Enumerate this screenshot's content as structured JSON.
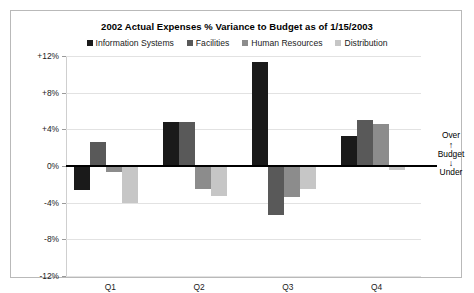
{
  "chart_data": {
    "type": "bar",
    "title": "2002 Actual Expenses % Variance to Budget as of 1/15/2003",
    "xlabel": "",
    "ylabel": "",
    "categories": [
      "Q1",
      "Q2",
      "Q3",
      "Q4"
    ],
    "series": [
      {
        "name": "Information Systems",
        "color": "#1a1a1a",
        "values": [
          -2.6,
          4.8,
          11.4,
          3.3
        ]
      },
      {
        "name": "Facilities",
        "color": "#595959",
        "values": [
          2.6,
          4.8,
          -5.3,
          5.0
        ]
      },
      {
        "name": "Human Resources",
        "color": "#8c8c8c",
        "values": [
          -0.7,
          -2.5,
          -3.4,
          4.6
        ]
      },
      {
        "name": "Distribution",
        "color": "#c6c6c6",
        "values": [
          -4.0,
          -3.3,
          -2.5,
          -0.4
        ]
      }
    ],
    "ylim": [
      -12,
      12
    ],
    "yticks": [
      12,
      8,
      4,
      0,
      -4,
      -8,
      -12
    ],
    "ytick_labels": [
      "+12%",
      "+8%",
      "+4%",
      "0%",
      "-4%",
      "-8%",
      "-12%"
    ],
    "grid": true,
    "legend_position": "top"
  },
  "annotation": {
    "over_label": "Over",
    "budget_label": "Budget",
    "under_label": "Under",
    "up_arrow": "↑",
    "down_arrow": "↓"
  }
}
